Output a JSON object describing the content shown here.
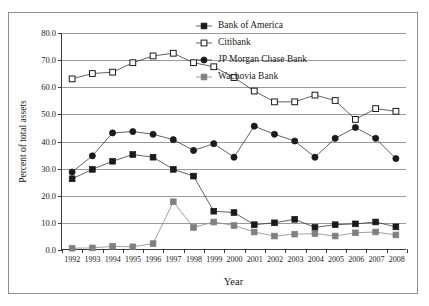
{
  "chart_data": {
    "type": "line",
    "title": "",
    "xlabel": "Year",
    "ylabel": "Percent of total assets",
    "grid": true,
    "legend_position": "top-right",
    "ylim": [
      0.0,
      80.0
    ],
    "ytick_step": 10.0,
    "yticks": [
      "0.0",
      "10.0",
      "20.0",
      "30.0",
      "40.0",
      "50.0",
      "60.0",
      "70.0",
      "80.0"
    ],
    "categories": [
      "1992",
      "1993",
      "1994",
      "1995",
      "1996",
      "1997",
      "1998",
      "1999",
      "2000",
      "2001",
      "2002",
      "2003",
      "2004",
      "2005",
      "2006",
      "2007",
      "2008"
    ],
    "series": [
      {
        "name": "Bank of America",
        "marker": "filled-square",
        "color": "#1a1a1a",
        "values": [
          26.0,
          29.5,
          32.5,
          35.0,
          34.0,
          29.5,
          27.0,
          14.0,
          13.5,
          9.0,
          9.7,
          11.0,
          8.0,
          9.0,
          9.3,
          10.0,
          8.2
        ]
      },
      {
        "name": "Citibank",
        "marker": "open-square",
        "color": "#1a1a1a",
        "values": [
          63.0,
          65.0,
          65.5,
          69.0,
          71.5,
          72.5,
          69.0,
          67.5,
          63.5,
          58.5,
          54.5,
          54.5,
          57.0,
          55.0,
          48.0,
          52.0,
          51.0
        ]
      },
      {
        "name": "JP Morgan Chase Bank",
        "marker": "filled-circle",
        "color": "#1a1a1a",
        "values": [
          28.5,
          34.5,
          43.0,
          43.5,
          42.5,
          40.5,
          36.5,
          39.0,
          34.0,
          45.5,
          42.5,
          40.0,
          34.0,
          41.0,
          45.0,
          41.0,
          33.5
        ]
      },
      {
        "name": "Wachovia Bank",
        "marker": "filled-square-gray",
        "color": "#808080",
        "values": [
          0.3,
          0.4,
          1.0,
          0.8,
          2.0,
          17.5,
          8.0,
          10.0,
          8.7,
          6.3,
          4.8,
          5.5,
          5.7,
          4.8,
          6.0,
          6.3,
          5.2
        ]
      }
    ]
  }
}
